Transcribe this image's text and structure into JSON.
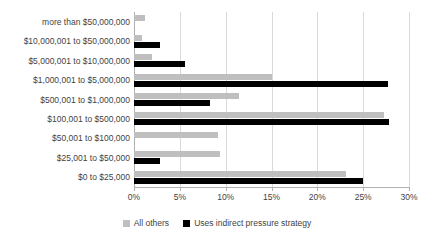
{
  "chart_data": {
    "type": "bar",
    "orientation": "horizontal",
    "title": "",
    "xlabel": "",
    "ylabel": "",
    "xlim": [
      0,
      30
    ],
    "xticks": [
      "0%",
      "5%",
      "10%",
      "15%",
      "20%",
      "25%",
      "30%"
    ],
    "xtick_values": [
      0,
      5,
      10,
      15,
      20,
      25,
      30
    ],
    "grid": true,
    "legend_position": "bottom",
    "categories": [
      "more than $50,000,000",
      "$10,000,001 to $50,000,000",
      "$5,000,001 to $10,000,000",
      "$1,000,001 to $5,000,000",
      "$500,001 to $1,000,000",
      "$100,001 to $500,000",
      "$50,001 to $100,000",
      "$25,001 to $50,000",
      "$0 to $25,000"
    ],
    "series": [
      {
        "name": "All others",
        "color": "#bfbfbf",
        "values": [
          1.2,
          0.9,
          2.0,
          15.0,
          11.4,
          27.3,
          9.2,
          9.4,
          23.1
        ]
      },
      {
        "name": "Uses indirect pressure strategy",
        "color": "#000000",
        "values": [
          0.0,
          2.8,
          5.6,
          27.7,
          8.3,
          27.8,
          0.0,
          2.8,
          25.0
        ]
      }
    ]
  },
  "legend": {
    "items": [
      {
        "label": "All others",
        "color": "#bfbfbf"
      },
      {
        "label": "Uses indirect pressure strategy",
        "color": "#000000"
      }
    ]
  }
}
